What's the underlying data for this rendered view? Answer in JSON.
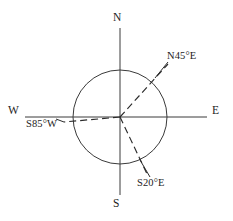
{
  "figure": {
    "width": 233,
    "height": 221,
    "background_color": "#ffffff",
    "line_color": "#3a3a3a",
    "ray_color": "#2b2b2b",
    "text_color": "#1c1c1c"
  },
  "compass": {
    "center": {
      "x": 120,
      "y": 117
    },
    "circle_radius": 47,
    "cardinals": [
      {
        "key": "north",
        "label": "N",
        "icon": "cardinal-north-label",
        "angle_deg": 0,
        "axis_end": {
          "x": 120,
          "y": 28
        }
      },
      {
        "key": "east",
        "label": "E",
        "icon": "cardinal-east-label",
        "angle_deg": 90,
        "axis_end": {
          "x": 207,
          "y": 117
        }
      },
      {
        "key": "south",
        "label": "S",
        "icon": "cardinal-south-label",
        "angle_deg": 180,
        "axis_end": {
          "x": 120,
          "y": 195
        }
      },
      {
        "key": "west",
        "label": "W",
        "icon": "cardinal-west-label",
        "angle_deg": 270,
        "axis_end": {
          "x": 25,
          "y": 117
        }
      }
    ]
  },
  "bearings": [
    {
      "key": "n45e",
      "label": "N45°E",
      "from_cardinal": "N",
      "angle_value": 45,
      "degree_symbol": "°",
      "toward_cardinal": "E",
      "quadrant": "northeast",
      "ray": {
        "x1": 120,
        "y1": 117,
        "x2": 168,
        "y2": 64
      },
      "leader": {
        "x1": 155,
        "y1": 78,
        "x2": 168,
        "y2": 62
      },
      "style": "dashed"
    },
    {
      "key": "s85w",
      "label": "S85°W",
      "from_cardinal": "S",
      "angle_value": 85,
      "degree_symbol": "°",
      "toward_cardinal": "W",
      "quadrant": "southwest",
      "ray": {
        "x1": 120,
        "y1": 117,
        "x2": 64,
        "y2": 122
      },
      "leader": {
        "x1": 64,
        "y1": 122,
        "x2": 56,
        "y2": 119
      },
      "style": "dashed"
    },
    {
      "key": "s20e",
      "label": "S20°E",
      "from_cardinal": "S",
      "angle_value": 20,
      "degree_symbol": "°",
      "toward_cardinal": "E",
      "quadrant": "southeast",
      "ray": {
        "x1": 120,
        "y1": 117,
        "x2": 148,
        "y2": 176
      },
      "leader": {
        "x1": 140,
        "y1": 160,
        "x2": 150,
        "y2": 177
      },
      "style": "dashed"
    }
  ]
}
